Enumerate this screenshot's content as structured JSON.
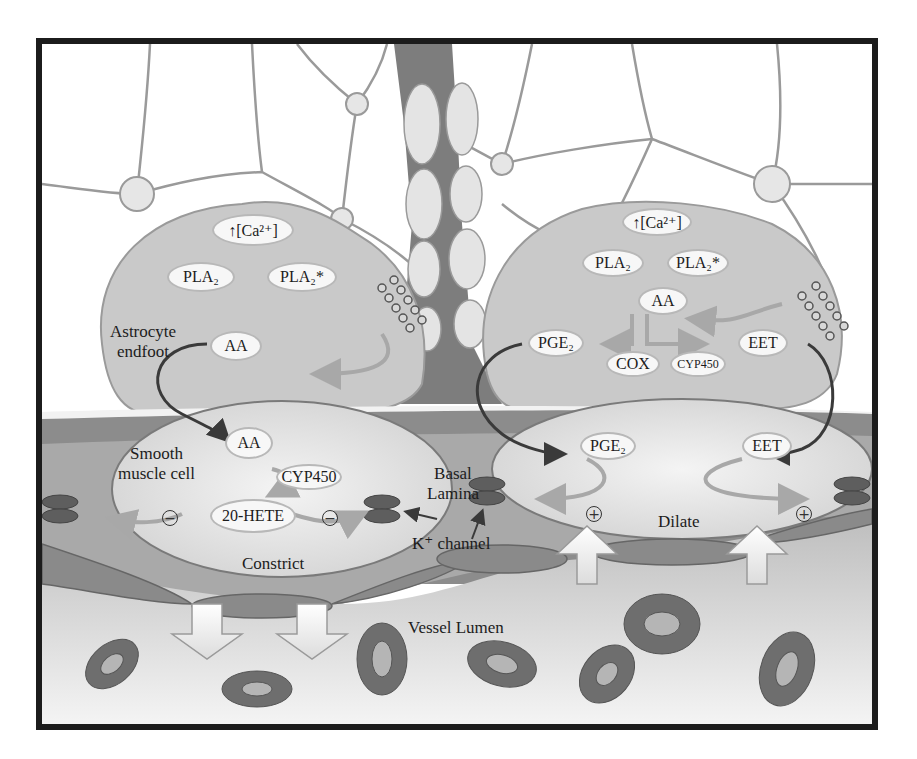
{
  "diagram": {
    "regions": {
      "astrocyte_label": [
        "Astrocyte",
        "endfoot"
      ],
      "smooth_muscle_label": [
        "Smooth",
        "muscle cell"
      ],
      "basal_lamina_label": [
        "Basal",
        "Lamina"
      ],
      "k_channel_label": "K⁺ channel",
      "vessel_lumen_label": "Vessel Lumen",
      "constrict_label": "Constrict",
      "dilate_label": "Dilate"
    },
    "left_endfoot": {
      "calcium": "↑[Ca²⁺]",
      "pla2": "PLA₂",
      "pla2_active": "PLA₂*",
      "aa": "AA"
    },
    "right_endfoot": {
      "calcium": "↑[Ca²⁺]",
      "pla2": "PLA₂",
      "pla2_active": "PLA₂*",
      "aa": "AA",
      "pge2": "PGE₂",
      "cox": "COX",
      "cyp450": "CYP450",
      "eet": "EET"
    },
    "left_smooth_muscle": {
      "aa": "AA",
      "cyp450": "CYP450",
      "hete": "20-HETE",
      "sign_left": "−",
      "sign_right": "−"
    },
    "right_smooth_muscle": {
      "pge2": "PGE₂",
      "eet": "EET",
      "sign_left": "+",
      "sign_right": "+"
    },
    "colors": {
      "frame": "#1c1c1c",
      "endfoot_fill": "#c9c9c9",
      "vessel_wall": "#8c8c8c",
      "smooth_muscle_fill": "#dedede",
      "k_channel": "#5e5e5e",
      "rbc": "#6e6e6e",
      "arrow_dark": "#3a3a3a",
      "arrow_light": "#a8a8a8"
    }
  }
}
